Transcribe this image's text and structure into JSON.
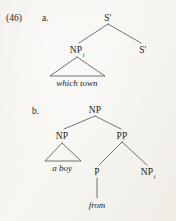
{
  "page": {
    "background_color": "#f7f5f1",
    "ink_color": "#232323",
    "width": 176,
    "height": 221
  },
  "example": {
    "number_label": "(46)",
    "items": [
      {
        "letter_label": "a."
      },
      {
        "letter_label": "b."
      }
    ]
  },
  "tree_a": {
    "caption_letter": "a.",
    "nodes": {
      "root": {
        "label": "S′",
        "x": 108,
        "y": 18
      },
      "left": {
        "label": "NP",
        "subscript": "i",
        "x": 77,
        "y": 50
      },
      "right": {
        "label": "S′",
        "subscript": "",
        "x": 143,
        "y": 50
      }
    },
    "triangle": {
      "apex_x": 77,
      "apex_y": 57,
      "left_x": 50,
      "right_x": 105,
      "base_y": 76
    },
    "terminal": {
      "text": "which town",
      "x": 77,
      "y": 84
    }
  },
  "tree_b": {
    "caption_letter": "b.",
    "nodes": {
      "root": {
        "label": "NP",
        "x": 95,
        "y": 110
      },
      "np_left": {
        "label": "NP",
        "x": 62,
        "y": 136
      },
      "pp": {
        "label": "PP",
        "x": 122,
        "y": 136
      },
      "p": {
        "label": "P",
        "x": 97,
        "y": 172
      },
      "np_right": {
        "label": "NP",
        "subscript": "i",
        "x": 148,
        "y": 172
      }
    },
    "triangle": {
      "apex_x": 62,
      "apex_y": 143,
      "left_x": 45,
      "right_x": 81,
      "base_y": 161
    },
    "terminals": [
      {
        "text": "a boy",
        "x": 62,
        "y": 169
      },
      {
        "text": "from",
        "x": 97,
        "y": 206
      }
    ],
    "p_stem": {
      "x": 97,
      "y_top": 178,
      "y_bottom": 198
    }
  }
}
